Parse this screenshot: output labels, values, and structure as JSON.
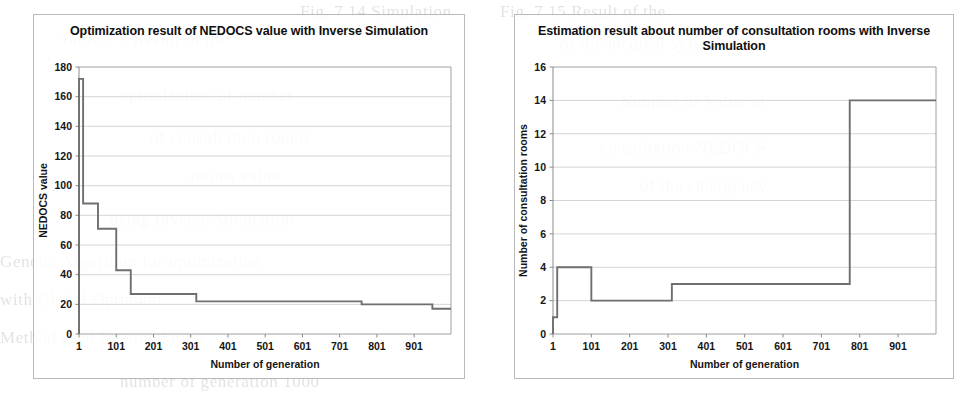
{
  "page": {
    "background_color": "#ffffff",
    "bleed_text": [
      "Fig. 7.14 Simulation",
      "of the medical system",
      "of the emergency",
      "Table 7.3 Result of the",
      "optimization of number",
      "of consultation rooms",
      "using Inverse Simulation",
      "Number of Value of",
      "consultation NEDOCS",
      "rooms value",
      "Genetic Algorithm for optimization",
      "with Global Optimum",
      "Method used for simulation",
      "number of generation 1000",
      "Fig. 7.15 Result of the"
    ]
  },
  "charts": [
    {
      "id": "chart-left",
      "title": "Optimization result of NEDOCS value with Inverse Simulation",
      "axis": {
        "xlabel": "Number of generation",
        "ylabel": "NEDOCS value",
        "xticks": [
          1,
          101,
          201,
          301,
          401,
          501,
          601,
          701,
          801,
          901
        ],
        "yticks": [
          0,
          20,
          40,
          60,
          80,
          100,
          120,
          140,
          160,
          180
        ],
        "xlim": [
          1,
          1000
        ],
        "ylim": [
          0,
          180
        ],
        "grid": true,
        "legend": "none"
      },
      "line_color": "#6f6f6f"
    },
    {
      "id": "chart-right",
      "title": "Estimation result about number of consultation rooms with Inverse Simulation",
      "axis": {
        "xlabel": "Number of generation",
        "ylabel": "Number of consultation rooms",
        "xticks": [
          1,
          101,
          201,
          301,
          401,
          501,
          601,
          701,
          801,
          901
        ],
        "yticks": [
          0,
          2,
          4,
          6,
          8,
          10,
          12,
          14,
          16
        ],
        "xlim": [
          1,
          1000
        ],
        "ylim": [
          0,
          16
        ],
        "grid": true,
        "legend": "none"
      },
      "line_color": "#6f6f6f"
    }
  ],
  "chart_data": [
    {
      "type": "line",
      "subtype": "step",
      "title": "Optimization result of NEDOCS value with Inverse Simulation",
      "xlabel": "Number of generation",
      "ylabel": "NEDOCS value",
      "xlim": [
        1,
        1000
      ],
      "ylim": [
        0,
        180
      ],
      "xticks": [
        1,
        101,
        201,
        301,
        401,
        501,
        601,
        701,
        801,
        901
      ],
      "yticks": [
        0,
        20,
        40,
        60,
        80,
        100,
        120,
        140,
        160,
        180
      ],
      "grid": true,
      "legend": "none",
      "series": [
        {
          "name": "NEDOCS value",
          "x": [
            1,
            1,
            12,
            12,
            52,
            52,
            101,
            101,
            140,
            140,
            316,
            316,
            760,
            760,
            950,
            950,
            1000
          ],
          "y": [
            0,
            172,
            172,
            88,
            88,
            71,
            71,
            43,
            43,
            27,
            27,
            22,
            22,
            20,
            20,
            17,
            17
          ]
        }
      ]
    },
    {
      "type": "line",
      "subtype": "step",
      "title": "Estimation result about number of consultation rooms with Inverse Simulation",
      "xlabel": "Number of generation",
      "ylabel": "Number of consultation rooms",
      "xlim": [
        1,
        1000
      ],
      "ylim": [
        0,
        16
      ],
      "xticks": [
        1,
        101,
        201,
        301,
        401,
        501,
        601,
        701,
        801,
        901
      ],
      "yticks": [
        0,
        2,
        4,
        6,
        8,
        10,
        12,
        14,
        16
      ],
      "grid": true,
      "legend": "none",
      "series": [
        {
          "name": "Number of consultation rooms",
          "x": [
            1,
            1,
            12,
            12,
            101,
            101,
            311,
            311,
            775,
            775,
            1000
          ],
          "y": [
            0,
            1,
            1,
            4,
            4,
            2,
            2,
            3,
            3,
            14,
            14
          ]
        }
      ]
    }
  ]
}
